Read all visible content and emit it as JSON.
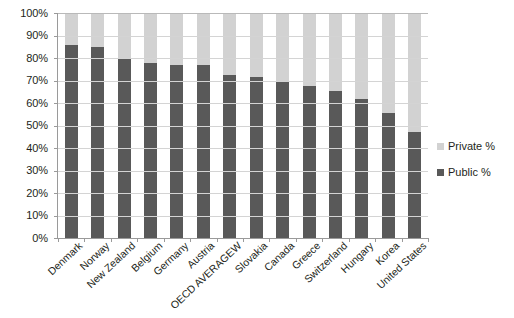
{
  "chart_data": {
    "type": "bar",
    "title": "",
    "subtitle": "",
    "xlabel": "",
    "ylabel": "",
    "stacked": true,
    "grid": true,
    "legend_position": "right",
    "ylim": [
      0,
      100
    ],
    "ytick_labels": [
      "100%",
      "90%",
      "80%",
      "70%",
      "60%",
      "50%",
      "40%",
      "30%",
      "20%",
      "10%",
      "0%"
    ],
    "ytick_values": [
      100,
      90,
      80,
      70,
      60,
      50,
      40,
      30,
      20,
      10,
      0
    ],
    "categories": [
      "Denmark",
      "Norway",
      "New Zealand",
      "Belgium",
      "Germany",
      "Austria",
      "OECD AVERAGEW",
      "Slovakia",
      "Canada",
      "Greece",
      "Switzerland",
      "Hungary",
      "Korea",
      "United States"
    ],
    "series": [
      {
        "name": "Public %",
        "color": "#595959",
        "values": [
          86,
          85,
          80,
          78,
          77,
          77,
          72.5,
          71.5,
          69.5,
          67.5,
          65.5,
          62,
          55.5,
          47
        ]
      },
      {
        "name": "Private %",
        "color": "#d2d2d2",
        "values": [
          14,
          15,
          20,
          22,
          23,
          23,
          27.5,
          28.5,
          30.5,
          32.5,
          34.5,
          38,
          44.5,
          53
        ]
      }
    ]
  },
  "legend": {
    "items": [
      {
        "label": "Private %",
        "color": "#d2d2d2"
      },
      {
        "label": "Public %",
        "color": "#595959"
      }
    ]
  }
}
